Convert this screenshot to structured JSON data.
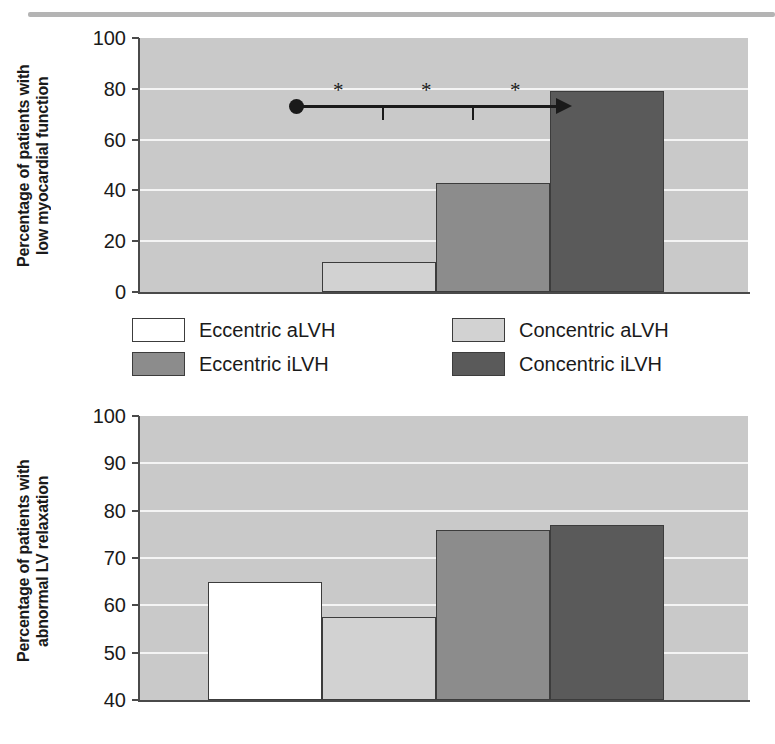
{
  "figure": {
    "rule_color": "#b4b4b4"
  },
  "legend": {
    "items": [
      {
        "label": "Eccentric aLVH",
        "color": "#ffffff"
      },
      {
        "label": "Concentric aLVH",
        "color": "#d2d2d2"
      },
      {
        "label": "Eccentric iLVH",
        "color": "#8c8c8c"
      },
      {
        "label": "Concentric iLVH",
        "color": "#5a5a5a"
      }
    ]
  },
  "chart_data": [
    {
      "id": "top-panel",
      "type": "bar",
      "title": "",
      "xlabel": "",
      "ylabel": "Percentage of patients with\nlow myocardial function",
      "categories": [
        "Eccentric aLVH",
        "Concentric aLVH",
        "Eccentric iLVH",
        "Concentric iLVH"
      ],
      "values": [
        0,
        12,
        43,
        79
      ],
      "colors": [
        "#c9c9c9",
        "#d2d2d2",
        "#8c8c8c",
        "#5a5a5a"
      ],
      "ylim": [
        0,
        100
      ],
      "yticks": [
        0,
        20,
        40,
        60,
        80,
        100
      ],
      "ytick_labels": [
        "0",
        "20",
        "40",
        "60",
        "80",
        "100"
      ],
      "grid": true,
      "grid_color": "#f4f4f4",
      "plot_background": "#c9c9c9",
      "legend_position": "below",
      "annotations": {
        "type": "trend-arrow",
        "description": "horizontal arrow with filled dot at origin indicating increasing trend",
        "stars": [
          "*",
          "*",
          "*"
        ],
        "star_meaning": "*"
      }
    },
    {
      "id": "bottom-panel",
      "type": "bar",
      "title": "",
      "xlabel": "",
      "ylabel": "Percentage of patients with\nabnormal LV relaxation",
      "categories": [
        "Eccentric aLVH",
        "Concentric aLVH",
        "Eccentric iLVH",
        "Concentric iLVH"
      ],
      "values": [
        65,
        57.5,
        76,
        77
      ],
      "colors": [
        "#ffffff",
        "#d2d2d2",
        "#8c8c8c",
        "#5a5a5a"
      ],
      "ylim": [
        40,
        100
      ],
      "yticks": [
        40,
        50,
        60,
        70,
        80,
        90,
        100
      ],
      "ytick_labels": [
        "40",
        "50",
        "60",
        "70",
        "80",
        "90",
        "100"
      ],
      "grid": true,
      "grid_color": "#f4f4f4",
      "plot_background": "#c9c9c9",
      "legend_position": "none"
    }
  ]
}
